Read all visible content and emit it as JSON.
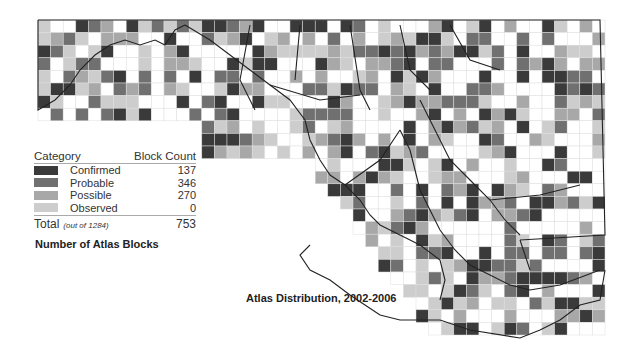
{
  "legend": {
    "header_category": "Category",
    "header_count": "Block Count",
    "items": [
      {
        "label": "Confirmed",
        "count": "137",
        "color": "#3a3a3a"
      },
      {
        "label": "Probable",
        "count": "346",
        "color": "#707070"
      },
      {
        "label": "Possible",
        "count": "270",
        "color": "#a8a8a8"
      },
      {
        "label": "Observed",
        "count": "0",
        "color": "#cdcdcd"
      }
    ],
    "total_label": "Total",
    "total_note": "(out of 1284)",
    "total_count": "753"
  },
  "subtitle": "Number of Atlas Blocks",
  "caption": "Atlas Distribution, 2002-2006",
  "colors": {
    "outline": "#222222",
    "grid": "#dddddd"
  }
}
